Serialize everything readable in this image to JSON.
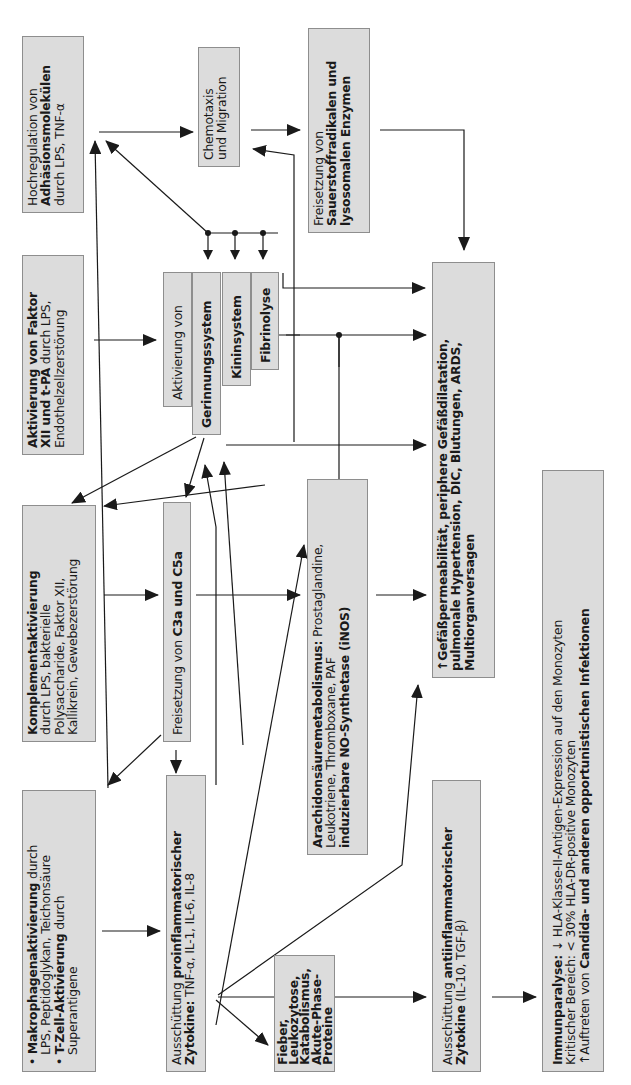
{
  "diagram": {
    "orientation": "rotated -90deg (text reads bottom-to-top)",
    "nodes": {
      "hochregulation": {
        "l1": "Hochregulation von",
        "l2": "Adhäsionsmolekülen",
        "l3": "durch LPS, TNF-α"
      },
      "chemotaxis": {
        "l1": "Chemotaxis",
        "l2": "und Migration"
      },
      "sauerstoff": {
        "l1": "Freisetzung von",
        "l2": "Sauerstoffradikalen und",
        "l3": "lysosomalen Enzymen"
      },
      "faktor12": {
        "l1": "Aktivierung von Faktor",
        "l2": "XII und t-PA",
        "l2b": " durch LPS,",
        "l3": "Endothelzellzerstörung"
      },
      "aktivierung_von": {
        "label": "Aktivierung von"
      },
      "gerinnung": {
        "label": "Gerinnungssystem"
      },
      "kinin": {
        "label": "Kininsystem"
      },
      "fibrinolyse": {
        "label": "Fibrinolyse"
      },
      "komplement": {
        "l1": "Komplementaktivierung",
        "l2": "durch LPS, bakterielle",
        "l3": "Polysaccharide, Faktor XII,",
        "l4": "Kallikrein, Gewebezerstörung"
      },
      "c3a": {
        "pre": "Freisetzung von ",
        "bold": "C3a und C5a"
      },
      "gefaess": {
        "l1": "↑Gefäßpermeabilität, periphere Gefäßdilatation,",
        "l2": "pulmonale Hypertension, DIC, Blutungen, ARDS,",
        "l3": "Multiorganversagen"
      },
      "arachidon": {
        "l1b": "Arachidonsäuremetabolismus:",
        "l1": " Prostaglandine,",
        "l2": "Leukotriene, Thromboxane, PAF",
        "l3": "induzierbare NO-Synthetase (iNOS)"
      },
      "makrophagen": {
        "bullet": "•",
        "l1b": "Makrophagenaktivierung",
        "l1": " durch",
        "l2": "LPS, Peptidoglykan, Teichonsäure",
        "l3b": "T-Zell-Aktivierung",
        "l3": " durch",
        "l4": "Superantigene"
      },
      "proinflammatorisch": {
        "l1": "Ausschüttung ",
        "l1b": "proinflammatorischer",
        "l2b": "Zytokine:",
        "l2": " TNF-α, IL-1, IL-6, IL-8"
      },
      "fieber": {
        "l1": "Fieber,",
        "l2": "Leukozytose,",
        "l3": "Katabolismus,",
        "l4": "Akute-Phase-",
        "l5": "Proteine"
      },
      "antiinflammatorisch": {
        "l1": "Ausschüttung ",
        "l1b": "antiinflammatorischer",
        "l2b": "Zytokine",
        "l2": " (IL-10, TGF-β)"
      },
      "immunparalyse": {
        "l1b": "Immunparalyse:",
        "l1": " ↓ HLA-Klasse-II-Antigen-Expression auf den Monozyten",
        "l2": "Kritischer Bereich: < 30% HLA-DR-positive Monozyten",
        "l3": "↑Auftreten von ",
        "l3b": "Candida- und anderen opportunistischen Infektionen"
      }
    },
    "colors": {
      "box_fill": "#dcdcdc",
      "box_border": "#8e8e8e",
      "arrow": "#1a1a1a"
    }
  }
}
